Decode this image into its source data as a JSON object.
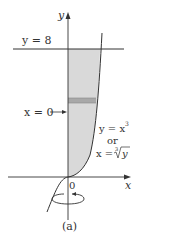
{
  "figure": {
    "caption": "(a)",
    "labels": {
      "y_axis": "y",
      "x_axis": "x",
      "origin": "0",
      "top_line": "y = 8",
      "left_boundary": "x = 0",
      "curve_eq1": "y = x",
      "curve_eq1_exp": "3",
      "curve_or": "or",
      "curve_eq2_lhs": "x = ",
      "curve_eq2_index": "3",
      "curve_eq2_rad": "y"
    },
    "colors": {
      "region_fill": "#d9d9d9",
      "strip_fill": "#a8a8a8",
      "line": "#333333"
    }
  }
}
